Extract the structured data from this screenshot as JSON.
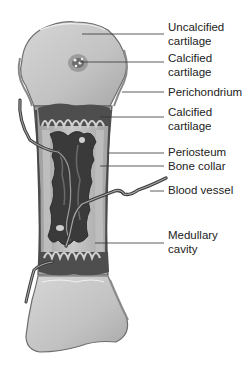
{
  "diagram": {
    "colors": {
      "cartilage": "#c4c4c4",
      "cartilage_edge": "#7a7a7a",
      "calcified": "#5a5a5a",
      "medulla": "#3e3e3e",
      "bone_collar": "#b4b4b4",
      "vessel": "#4a4a4a",
      "leader": "#333333",
      "text": "#222222"
    },
    "labels": [
      {
        "id": "uncalcified-cartilage",
        "lines": [
          "Uncalcified",
          "cartilage"
        ],
        "top": 21,
        "line_y": 34,
        "target_x": 82
      },
      {
        "id": "calcified-cartilage-top",
        "lines": [
          "Calcified",
          "cartilage"
        ],
        "top": 52,
        "line_y": 62,
        "target_x": 80
      },
      {
        "id": "perichondrium",
        "lines": [
          "Perichondrium"
        ],
        "top": 86,
        "line_y": 92,
        "target_x": 122
      },
      {
        "id": "calcified-cartilage-shaft",
        "lines": [
          "Calcified",
          "cartilage"
        ],
        "top": 106,
        "line_y": 117,
        "target_x": 100
      },
      {
        "id": "periosteum",
        "lines": [
          "Periosteum"
        ],
        "top": 146,
        "line_y": 153,
        "target_x": 108
      },
      {
        "id": "bone-collar",
        "lines": [
          "Bone collar"
        ],
        "top": 160,
        "line_y": 166,
        "target_x": 100
      },
      {
        "id": "blood-vessel",
        "lines": [
          "Blood vessel"
        ],
        "top": 184,
        "line_y": 191,
        "target_x": 150
      },
      {
        "id": "medullary-cavity",
        "lines": [
          "Medullary",
          "cavity"
        ],
        "top": 229,
        "line_y": 243,
        "target_x": 95
      }
    ]
  }
}
